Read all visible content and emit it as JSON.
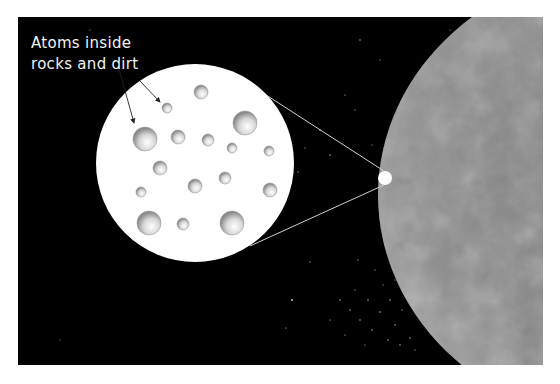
{
  "diagram": {
    "caption_line1": "Atoms inside",
    "caption_line2": "rocks and dirt",
    "background_color": "#000000",
    "magnifier_color": "#ffffff",
    "planet_color": "#8a8a8a",
    "atoms": [
      {
        "x": 201,
        "y": 92,
        "r": 7
      },
      {
        "x": 167,
        "y": 108,
        "r": 5
      },
      {
        "x": 245,
        "y": 123,
        "r": 12
      },
      {
        "x": 145,
        "y": 139,
        "r": 12
      },
      {
        "x": 178,
        "y": 137,
        "r": 7
      },
      {
        "x": 208,
        "y": 140,
        "r": 6
      },
      {
        "x": 232,
        "y": 148,
        "r": 5
      },
      {
        "x": 269,
        "y": 151,
        "r": 5
      },
      {
        "x": 160,
        "y": 168,
        "r": 7
      },
      {
        "x": 195,
        "y": 186,
        "r": 7
      },
      {
        "x": 225,
        "y": 178,
        "r": 6
      },
      {
        "x": 141,
        "y": 192,
        "r": 5
      },
      {
        "x": 270,
        "y": 190,
        "r": 7
      },
      {
        "x": 149,
        "y": 223,
        "r": 12
      },
      {
        "x": 183,
        "y": 224,
        "r": 6
      },
      {
        "x": 232,
        "y": 223,
        "r": 12
      }
    ]
  }
}
